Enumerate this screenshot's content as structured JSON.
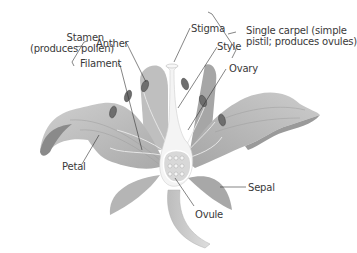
{
  "diagram": {
    "colors": {
      "petal": "#b9b9b9",
      "petal_dark": "#8e8e8e",
      "petal_light": "#d4d4d4",
      "anther": "#6e6e6e",
      "pistil": "#f2f2f2",
      "label_text": "#3a3a3a",
      "leader_line": "#333333"
    },
    "labels": {
      "stamen_line1": "Stamen",
      "stamen_line2": "(produces pollen)",
      "anther": "Anther",
      "filament": "Filament",
      "stigma": "Stigma",
      "style": "Style",
      "ovary": "Ovary",
      "carpel_line1": "Single carpel (simple",
      "carpel_line2": "pistil; produces ovules)",
      "petal": "Petal",
      "sepal": "Sepal",
      "ovule": "Ovule"
    }
  }
}
